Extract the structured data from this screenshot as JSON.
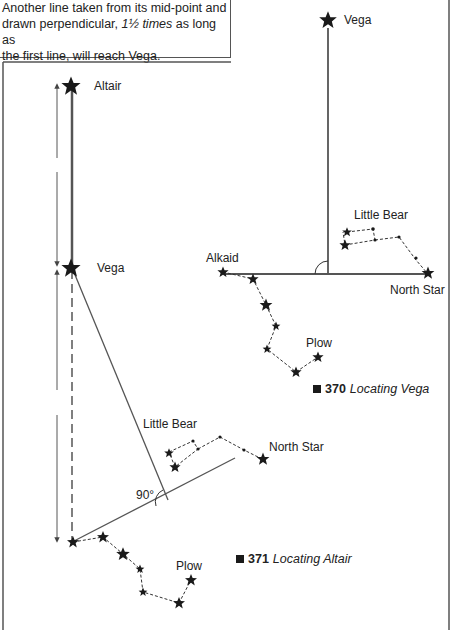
{
  "caption": {
    "line1": "Another line taken from its mid-point and",
    "line2_prefix": "drawn perpendicular, ",
    "line2_italic": "1½ times",
    "line2_suffix": " as long as",
    "line3": "the first line, will reach Vega."
  },
  "figure_370": {
    "number": "370",
    "title": "Locating Vega",
    "labels": {
      "vega": "Vega",
      "little_bear": "Little Bear",
      "alkaid": "Alkaid",
      "north_star": "North Star",
      "plow": "Plow"
    }
  },
  "figure_371": {
    "number": "371",
    "title": "Locating Altair",
    "labels": {
      "altair": "Altair",
      "vega": "Vega",
      "little_bear": "Little Bear",
      "north_star": "North Star",
      "plow": "Plow",
      "angle": "90°"
    }
  },
  "colors": {
    "ink": "#1a1a1a",
    "line": "#555555"
  }
}
